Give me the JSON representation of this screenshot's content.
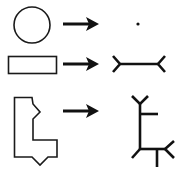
{
  "diagram": {
    "title": "",
    "colors": {
      "stroke": "#111111",
      "background": "#ffffff"
    },
    "rows": [
      {
        "id": "circle",
        "input_shape": "circle",
        "relation": "arrow-right",
        "output": "point skeleton"
      },
      {
        "id": "rectangle",
        "input_shape": "rectangle",
        "relation": "arrow-right",
        "output": "line skeleton with forked ends"
      },
      {
        "id": "l-shape",
        "input_shape": "notched L-shaped polygon",
        "relation": "arrow-right",
        "output": "branched tree skeleton"
      }
    ]
  }
}
